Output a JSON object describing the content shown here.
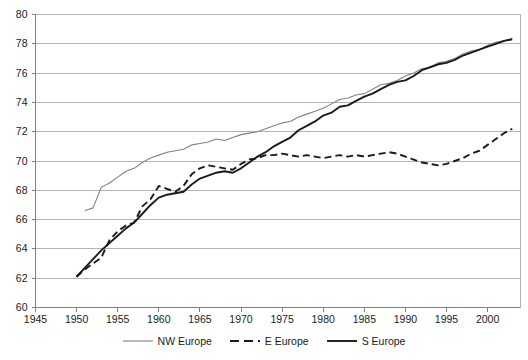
{
  "chart_data": {
    "type": "line",
    "title": "",
    "subtitle": "",
    "xlabel": "",
    "ylabel": "",
    "xlim": [
      1945,
      2004
    ],
    "ylim": [
      60,
      80
    ],
    "ytick_step": 2,
    "xtick_step": 5,
    "grid": "horizontal",
    "legend_position": "bottom",
    "xticks": [
      "1945",
      "1950",
      "1955",
      "1960",
      "1965",
      "1970",
      "1975",
      "1980",
      "1985",
      "1990",
      "1995",
      "2000"
    ],
    "yticks": [
      "60",
      "62",
      "64",
      "66",
      "68",
      "70",
      "72",
      "74",
      "76",
      "78",
      "80"
    ],
    "colors": {
      "nw_europe": "#808080",
      "e_europe": "#1a1a1a",
      "s_europe": "#1a1a1a",
      "grid": "#b3b3b3",
      "axis": "#808080",
      "background": "#ffffff"
    },
    "series": [
      {
        "name": "NW Europe",
        "style": "solid-thin",
        "color": "#808080",
        "x": [
          1951,
          1952,
          1953,
          1954,
          1955,
          1956,
          1957,
          1958,
          1959,
          1960,
          1961,
          1962,
          1963,
          1964,
          1965,
          1966,
          1967,
          1968,
          1969,
          1970,
          1971,
          1972,
          1973,
          1974,
          1975,
          1976,
          1977,
          1978,
          1979,
          1980,
          1981,
          1982,
          1983,
          1984,
          1985,
          1986,
          1987,
          1988,
          1989,
          1990,
          1991,
          1992,
          1993,
          1994,
          1995,
          1996,
          1997,
          1998,
          1999,
          2000,
          2001,
          2002,
          2003
        ],
        "values": [
          66.6,
          66.8,
          68.2,
          68.5,
          68.9,
          69.3,
          69.5,
          69.9,
          70.2,
          70.4,
          70.6,
          70.7,
          70.8,
          71.1,
          71.2,
          71.3,
          71.5,
          71.4,
          71.6,
          71.8,
          71.9,
          72.0,
          72.2,
          72.4,
          72.6,
          72.7,
          73.0,
          73.2,
          73.4,
          73.6,
          73.9,
          74.2,
          74.3,
          74.5,
          74.6,
          74.9,
          75.2,
          75.3,
          75.5,
          75.8,
          76.0,
          76.3,
          76.4,
          76.7,
          76.8,
          77.0,
          77.3,
          77.5,
          77.6,
          77.9,
          78.1,
          78.2,
          78.4
        ]
      },
      {
        "name": "E Europe",
        "style": "dashed",
        "color": "#1a1a1a",
        "x": [
          1950,
          1951,
          1952,
          1953,
          1954,
          1955,
          1956,
          1957,
          1958,
          1959,
          1960,
          1961,
          1962,
          1963,
          1964,
          1965,
          1966,
          1967,
          1968,
          1969,
          1970,
          1971,
          1972,
          1973,
          1974,
          1975,
          1976,
          1977,
          1978,
          1979,
          1980,
          1981,
          1982,
          1983,
          1984,
          1985,
          1986,
          1987,
          1988,
          1989,
          1990,
          1991,
          1992,
          1993,
          1994,
          1995,
          1996,
          1997,
          1998,
          1999,
          2000,
          2001,
          2002,
          2003
        ],
        "values": [
          62.1,
          62.6,
          63.0,
          63.4,
          64.6,
          65.2,
          65.6,
          65.8,
          66.9,
          67.4,
          68.3,
          68.1,
          67.9,
          68.3,
          69.1,
          69.5,
          69.7,
          69.6,
          69.5,
          69.4,
          69.8,
          70.1,
          70.2,
          70.4,
          70.4,
          70.5,
          70.4,
          70.3,
          70.4,
          70.3,
          70.2,
          70.3,
          70.4,
          70.3,
          70.4,
          70.3,
          70.4,
          70.5,
          70.6,
          70.5,
          70.3,
          70.1,
          69.9,
          69.8,
          69.7,
          69.8,
          70.0,
          70.2,
          70.5,
          70.7,
          71.1,
          71.5,
          71.9,
          72.2
        ]
      },
      {
        "name": "S Europe",
        "style": "solid-thick",
        "color": "#1a1a1a",
        "x": [
          1950,
          1951,
          1952,
          1953,
          1954,
          1955,
          1956,
          1957,
          1958,
          1959,
          1960,
          1961,
          1962,
          1963,
          1964,
          1965,
          1966,
          1967,
          1968,
          1969,
          1970,
          1971,
          1972,
          1973,
          1974,
          1975,
          1976,
          1977,
          1978,
          1979,
          1980,
          1981,
          1982,
          1983,
          1984,
          1985,
          1986,
          1987,
          1988,
          1989,
          1990,
          1991,
          1992,
          1993,
          1994,
          1995,
          1996,
          1997,
          1998,
          1999,
          2000,
          2001,
          2002,
          2003
        ],
        "values": [
          62.1,
          62.7,
          63.3,
          63.9,
          64.4,
          64.9,
          65.4,
          65.8,
          66.4,
          67.0,
          67.5,
          67.7,
          67.8,
          67.9,
          68.4,
          68.8,
          69.0,
          69.2,
          69.3,
          69.2,
          69.5,
          69.9,
          70.3,
          70.6,
          71.0,
          71.3,
          71.6,
          72.1,
          72.4,
          72.7,
          73.1,
          73.3,
          73.7,
          73.8,
          74.1,
          74.4,
          74.6,
          74.9,
          75.2,
          75.4,
          75.5,
          75.8,
          76.2,
          76.4,
          76.6,
          76.7,
          76.9,
          77.2,
          77.4,
          77.6,
          77.8,
          78.0,
          78.2,
          78.3
        ]
      }
    ]
  },
  "legend": {
    "items": [
      {
        "label": "NW Europe",
        "style": "solid-thin",
        "color": "#808080"
      },
      {
        "label": "E Europe",
        "style": "dashed",
        "color": "#1a1a1a"
      },
      {
        "label": "S Europe",
        "style": "solid-thick",
        "color": "#1a1a1a"
      }
    ]
  }
}
